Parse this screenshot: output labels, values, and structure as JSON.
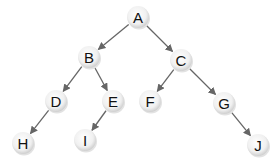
{
  "diagram": {
    "type": "binary-tree",
    "colors": {
      "edge": "#666666",
      "node_fill_center": "#ffffff",
      "node_fill_edge": "#d4d4d4",
      "label": "#111111"
    },
    "nodes": [
      {
        "id": "A",
        "label": "A",
        "x": 138,
        "y": 17
      },
      {
        "id": "B",
        "label": "B",
        "x": 89,
        "y": 57
      },
      {
        "id": "C",
        "label": "C",
        "x": 181,
        "y": 60
      },
      {
        "id": "D",
        "label": "D",
        "x": 56,
        "y": 101
      },
      {
        "id": "E",
        "label": "E",
        "x": 113,
        "y": 101
      },
      {
        "id": "F",
        "label": "F",
        "x": 150,
        "y": 101
      },
      {
        "id": "G",
        "label": "G",
        "x": 224,
        "y": 103
      },
      {
        "id": "H",
        "label": "H",
        "x": 23,
        "y": 143
      },
      {
        "id": "I",
        "label": "I",
        "x": 85,
        "y": 140
      },
      {
        "id": "J",
        "label": "J",
        "x": 258,
        "y": 145
      }
    ],
    "edges": [
      {
        "from": "A",
        "to": "B"
      },
      {
        "from": "A",
        "to": "C"
      },
      {
        "from": "B",
        "to": "D"
      },
      {
        "from": "B",
        "to": "E"
      },
      {
        "from": "C",
        "to": "F"
      },
      {
        "from": "C",
        "to": "G"
      },
      {
        "from": "D",
        "to": "H"
      },
      {
        "from": "E",
        "to": "I"
      },
      {
        "from": "G",
        "to": "J"
      }
    ]
  }
}
